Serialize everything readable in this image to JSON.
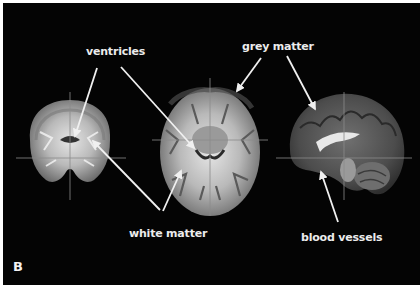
{
  "figure": {
    "panel_label": "B",
    "background_color": "#040404",
    "border_color": "#ffffff",
    "label_color": "#ececec",
    "arrow_color": "#f0f0f0",
    "crosshair_color": "#8a8a8a"
  },
  "labels": {
    "ventricles": "ventricles",
    "grey_matter": "grey matter",
    "white_matter": "white matter",
    "blood_vessels": "blood vessels"
  },
  "images": [
    {
      "view": "coronal",
      "name": "coronal-brain-slice"
    },
    {
      "view": "axial",
      "name": "axial-brain-slice"
    },
    {
      "view": "sagittal",
      "name": "sagittal-brain-slice"
    }
  ]
}
